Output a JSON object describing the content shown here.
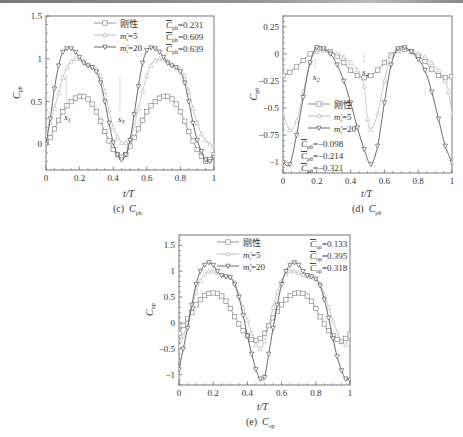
{
  "chart_data": [
    {
      "id": "c",
      "type": "line",
      "caption": "(c)  C_ph",
      "caption_prefix": "(c)",
      "caption_symbol": "C",
      "caption_sub": "ph",
      "xlabel": "t/T",
      "ylabel": "C_ph",
      "ylabel_sub": "ph",
      "xlim": [
        0,
        1
      ],
      "ylim": [
        -0.3,
        1.5
      ],
      "xticks": [
        0,
        0.2,
        0.4,
        0.6,
        0.8,
        1
      ],
      "xtick_labels": [
        "0",
        "0.2",
        "0.4",
        "0.6",
        "0.8",
        "1"
      ],
      "yticks": [
        0,
        0.5,
        1,
        1.5
      ],
      "ytick_labels": [
        "0",
        "0.5",
        "1",
        "1.5"
      ],
      "legend": [
        "刚性",
        "m*=5",
        "m*=20"
      ],
      "legend_position": "upper center",
      "mean_labels": [
        "C̄ph=0.231",
        "C̄ph=0.609",
        "C̄ph=0.639"
      ],
      "mean_values": [
        0.231,
        0.609,
        0.639
      ],
      "annotations": [
        {
          "text": "s1",
          "x": 0.12,
          "y": 0.38
        },
        {
          "text": "s3",
          "x": 0.44,
          "y": 0.35
        }
      ],
      "series": [
        {
          "name": "刚性",
          "marker": "square",
          "color": "#8a8a8a",
          "x": [
            0,
            0.025,
            0.05,
            0.075,
            0.1,
            0.125,
            0.15,
            0.175,
            0.2,
            0.225,
            0.25,
            0.275,
            0.3,
            0.325,
            0.35,
            0.375,
            0.4,
            0.425,
            0.45,
            0.475,
            0.5,
            0.525,
            0.55,
            0.575,
            0.6,
            0.625,
            0.65,
            0.675,
            0.7,
            0.725,
            0.75,
            0.775,
            0.8,
            0.825,
            0.85,
            0.875,
            0.9,
            0.925,
            0.95,
            0.975,
            1
          ],
          "values": [
            0.02,
            0.08,
            0.18,
            0.28,
            0.38,
            0.45,
            0.5,
            0.54,
            0.56,
            0.56,
            0.53,
            0.47,
            0.38,
            0.27,
            0.15,
            0.04,
            -0.06,
            -0.12,
            -0.15,
            -0.12,
            -0.02,
            0.08,
            0.18,
            0.28,
            0.38,
            0.45,
            0.5,
            0.54,
            0.56,
            0.56,
            0.53,
            0.47,
            0.38,
            0.27,
            0.15,
            0.04,
            -0.06,
            -0.14,
            -0.2,
            -0.18,
            -0.12
          ]
        },
        {
          "name": "m*=5",
          "marker": "triangle-up",
          "color": "#b5b5b5",
          "x": [
            0,
            0.025,
            0.05,
            0.075,
            0.1,
            0.125,
            0.15,
            0.175,
            0.2,
            0.225,
            0.25,
            0.275,
            0.3,
            0.325,
            0.35,
            0.375,
            0.4,
            0.425,
            0.45,
            0.475,
            0.5,
            0.525,
            0.55,
            0.575,
            0.6,
            0.625,
            0.65,
            0.675,
            0.7,
            0.725,
            0.75,
            0.775,
            0.8,
            0.825,
            0.85,
            0.875,
            0.9,
            0.925,
            0.95,
            0.975,
            1
          ],
          "values": [
            0.1,
            0.25,
            0.42,
            0.6,
            0.78,
            0.9,
            0.97,
            1.0,
            1.0,
            0.97,
            0.93,
            0.9,
            0.88,
            0.8,
            0.62,
            0.4,
            0.2,
            0.08,
            0.02,
            0.02,
            0.06,
            0.22,
            0.42,
            0.62,
            0.8,
            0.92,
            0.98,
            1.0,
            1.0,
            0.97,
            0.93,
            0.9,
            0.88,
            0.8,
            0.62,
            0.42,
            0.25,
            0.12,
            0.05,
            0.0,
            -0.02
          ]
        },
        {
          "name": "m*=20",
          "marker": "triangle-down",
          "color": "#5a5a5a",
          "x": [
            0,
            0.025,
            0.05,
            0.075,
            0.1,
            0.125,
            0.15,
            0.175,
            0.2,
            0.225,
            0.25,
            0.275,
            0.3,
            0.325,
            0.35,
            0.375,
            0.4,
            0.425,
            0.45,
            0.475,
            0.5,
            0.525,
            0.55,
            0.575,
            0.6,
            0.625,
            0.65,
            0.675,
            0.7,
            0.725,
            0.75,
            0.775,
            0.8,
            0.825,
            0.85,
            0.875,
            0.9,
            0.925,
            0.95,
            0.975,
            1
          ],
          "values": [
            0.0,
            0.3,
            0.65,
            0.92,
            1.08,
            1.12,
            1.12,
            1.08,
            1.02,
            0.95,
            0.92,
            0.9,
            0.85,
            0.72,
            0.5,
            0.25,
            0.02,
            -0.12,
            -0.18,
            -0.12,
            0.05,
            0.35,
            0.68,
            0.95,
            1.1,
            1.13,
            1.12,
            1.08,
            1.02,
            0.95,
            0.92,
            0.9,
            0.85,
            0.72,
            0.5,
            0.25,
            0.05,
            -0.08,
            -0.18,
            -0.2,
            -0.15
          ]
        }
      ]
    },
    {
      "id": "d",
      "type": "line",
      "caption": "(d)  C_pθ",
      "caption_prefix": "(d)",
      "caption_symbol": "C",
      "caption_sub": "pθ",
      "xlabel": "t/T",
      "ylabel": "C_pθ",
      "ylabel_sub": "pθ",
      "xlim": [
        0,
        1
      ],
      "ylim": [
        -1.1,
        0.35
      ],
      "xticks": [
        0,
        0.2,
        0.4,
        0.6,
        0.8,
        1
      ],
      "xtick_labels": [
        "0",
        "0.2",
        "0.4",
        "0.6",
        "0.8",
        "1"
      ],
      "yticks": [
        -1,
        -0.75,
        -0.5,
        -0.25,
        0,
        0.25
      ],
      "ytick_labels": [
        "-1",
        "-0.75",
        "-0.5",
        "-0.25",
        "0",
        "0.25"
      ],
      "legend": [
        "刚性",
        "m*=5",
        "m*=20"
      ],
      "legend_position": "lower left",
      "mean_labels": [
        "C̄pθ=−0.098",
        "C̄pθ=−0.214",
        "C̄pθ=−0.321"
      ],
      "mean_values": [
        -0.098,
        -0.214,
        -0.321
      ],
      "annotations": [
        {
          "text": "s2",
          "x": 0.19,
          "y": -0.17
        },
        {
          "text": "s4",
          "x": 0.48,
          "y": -0.12
        }
      ],
      "series": [
        {
          "name": "刚性",
          "marker": "square",
          "color": "#8a8a8a",
          "x": [
            0,
            0.04,
            0.08,
            0.12,
            0.16,
            0.2,
            0.24,
            0.28,
            0.32,
            0.36,
            0.4,
            0.44,
            0.48,
            0.52,
            0.56,
            0.6,
            0.64,
            0.68,
            0.72,
            0.76,
            0.8,
            0.84,
            0.88,
            0.92,
            0.96,
            1
          ],
          "values": [
            -0.2,
            -0.17,
            -0.12,
            -0.06,
            0.0,
            0.04,
            0.04,
            0.02,
            -0.02,
            -0.08,
            -0.15,
            -0.2,
            -0.22,
            -0.2,
            -0.15,
            -0.08,
            -0.01,
            0.03,
            0.04,
            0.02,
            -0.02,
            -0.07,
            -0.14,
            -0.2,
            -0.22,
            -0.21
          ]
        },
        {
          "name": "m*=5",
          "marker": "triangle-up",
          "color": "#b5b5b5",
          "x": [
            0,
            0.04,
            0.08,
            0.12,
            0.16,
            0.2,
            0.24,
            0.28,
            0.32,
            0.36,
            0.4,
            0.44,
            0.48,
            0.5,
            0.52,
            0.56,
            0.6,
            0.64,
            0.68,
            0.72,
            0.76,
            0.8,
            0.84,
            0.88,
            0.92,
            0.96,
            0.98,
            1
          ],
          "values": [
            -0.55,
            -0.7,
            -0.62,
            -0.35,
            -0.08,
            0.02,
            0.03,
            0.02,
            0.0,
            -0.03,
            -0.08,
            -0.15,
            -0.3,
            -0.6,
            -0.7,
            -0.55,
            -0.25,
            -0.02,
            0.05,
            0.04,
            0.02,
            0.0,
            -0.03,
            -0.08,
            -0.15,
            -0.25,
            -0.35,
            -0.55
          ]
        },
        {
          "name": "m*=20",
          "marker": "triangle-down",
          "color": "#5a5a5a",
          "x": [
            0,
            0.04,
            0.08,
            0.12,
            0.16,
            0.2,
            0.24,
            0.28,
            0.32,
            0.36,
            0.4,
            0.44,
            0.48,
            0.52,
            0.56,
            0.6,
            0.64,
            0.68,
            0.72,
            0.76,
            0.8,
            0.84,
            0.88,
            0.92,
            0.96,
            1
          ],
          "values": [
            -1.0,
            -1.02,
            -0.75,
            -0.4,
            -0.08,
            0.06,
            0.05,
            0.0,
            -0.1,
            -0.25,
            -0.45,
            -0.68,
            -0.88,
            -1.02,
            -0.85,
            -0.45,
            -0.1,
            0.05,
            0.06,
            0.02,
            -0.05,
            -0.15,
            -0.35,
            -0.6,
            -0.85,
            -1.0
          ]
        }
      ]
    },
    {
      "id": "e",
      "type": "line",
      "caption": "(e)  C_op",
      "caption_prefix": "(e)",
      "caption_symbol": "C",
      "caption_sub": "op",
      "xlabel": "t/T",
      "ylabel": "C_op",
      "ylabel_sub": "op",
      "xlim": [
        0,
        1
      ],
      "ylim": [
        -1.2,
        1.7
      ],
      "xticks": [
        0,
        0.2,
        0.4,
        0.6,
        0.8,
        1
      ],
      "xtick_labels": [
        "0",
        "0.2",
        "0.4",
        "0.6",
        "0.8",
        "1"
      ],
      "yticks": [
        -1,
        -0.5,
        0,
        0.5,
        1,
        1.5
      ],
      "ytick_labels": [
        "-1",
        "-0.5",
        "0",
        "0.5",
        "1",
        "1.5"
      ],
      "legend": [
        "刚性",
        "m*=5",
        "m*=20"
      ],
      "legend_position": "upper left",
      "mean_labels": [
        "C̄op=0.133",
        "C̄op=0.395",
        "C̄op=0.318"
      ],
      "mean_values": [
        0.133,
        0.395,
        0.318
      ],
      "annotations": [],
      "series": [
        {
          "name": "刚性",
          "marker": "square",
          "color": "#8a8a8a",
          "x": [
            0,
            0.025,
            0.05,
            0.075,
            0.1,
            0.125,
            0.15,
            0.175,
            0.2,
            0.225,
            0.25,
            0.275,
            0.3,
            0.325,
            0.35,
            0.375,
            0.4,
            0.425,
            0.45,
            0.475,
            0.5,
            0.525,
            0.55,
            0.575,
            0.6,
            0.625,
            0.65,
            0.675,
            0.7,
            0.725,
            0.75,
            0.775,
            0.8,
            0.825,
            0.85,
            0.875,
            0.9,
            0.925,
            0.95,
            0.975,
            1
          ],
          "values": [
            -0.2,
            -0.05,
            0.08,
            0.2,
            0.35,
            0.45,
            0.53,
            0.57,
            0.58,
            0.57,
            0.52,
            0.42,
            0.28,
            0.12,
            -0.02,
            -0.15,
            -0.25,
            -0.32,
            -0.34,
            -0.3,
            -0.2,
            -0.05,
            0.1,
            0.22,
            0.35,
            0.45,
            0.53,
            0.57,
            0.58,
            0.57,
            0.52,
            0.42,
            0.28,
            0.12,
            -0.02,
            -0.15,
            -0.25,
            -0.32,
            -0.36,
            -0.3,
            -0.22
          ]
        },
        {
          "name": "m*=5",
          "marker": "triangle-up",
          "color": "#b5b5b5",
          "x": [
            0,
            0.025,
            0.05,
            0.075,
            0.1,
            0.125,
            0.15,
            0.175,
            0.2,
            0.225,
            0.25,
            0.275,
            0.3,
            0.325,
            0.35,
            0.375,
            0.4,
            0.425,
            0.45,
            0.475,
            0.5,
            0.525,
            0.55,
            0.575,
            0.6,
            0.625,
            0.65,
            0.675,
            0.7,
            0.725,
            0.75,
            0.775,
            0.8,
            0.825,
            0.85,
            0.875,
            0.9,
            0.925,
            0.95,
            0.975,
            1
          ],
          "values": [
            -0.45,
            -0.25,
            0.0,
            0.3,
            0.6,
            0.82,
            0.95,
            1.0,
            1.0,
            0.97,
            0.93,
            0.9,
            0.88,
            0.78,
            0.55,
            0.3,
            0.05,
            -0.2,
            -0.42,
            -0.5,
            -0.35,
            -0.05,
            0.3,
            0.6,
            0.82,
            0.95,
            1.0,
            1.0,
            0.97,
            0.93,
            0.9,
            0.88,
            0.85,
            0.75,
            0.55,
            0.3,
            0.05,
            -0.18,
            -0.35,
            -0.42,
            -0.25
          ]
        },
        {
          "name": "m*=20",
          "marker": "triangle-down",
          "color": "#5a5a5a",
          "x": [
            0,
            0.025,
            0.05,
            0.075,
            0.1,
            0.125,
            0.15,
            0.175,
            0.2,
            0.225,
            0.25,
            0.275,
            0.3,
            0.325,
            0.35,
            0.375,
            0.4,
            0.425,
            0.45,
            0.475,
            0.5,
            0.525,
            0.55,
            0.575,
            0.6,
            0.625,
            0.65,
            0.675,
            0.7,
            0.725,
            0.75,
            0.775,
            0.8,
            0.825,
            0.85,
            0.875,
            0.9,
            0.925,
            0.95,
            0.975,
            1
          ],
          "values": [
            -0.9,
            -0.5,
            -0.1,
            0.35,
            0.75,
            1.0,
            1.12,
            1.17,
            1.12,
            1.0,
            0.92,
            0.9,
            0.88,
            0.75,
            0.5,
            0.15,
            -0.25,
            -0.6,
            -0.9,
            -1.08,
            -1.05,
            -0.6,
            -0.1,
            0.35,
            0.75,
            1.0,
            1.12,
            1.17,
            1.12,
            1.0,
            0.92,
            0.9,
            0.85,
            0.72,
            0.45,
            0.1,
            -0.3,
            -0.65,
            -0.92,
            -1.08,
            -1.1
          ]
        }
      ]
    }
  ],
  "layout": {
    "panels": [
      {
        "x0": 46,
        "y0": 16,
        "x1": 214,
        "y1": 170
      },
      {
        "x0": 283,
        "y0": 16,
        "x1": 452,
        "y1": 173
      },
      {
        "x0": 179,
        "y0": 235,
        "x1": 350,
        "y1": 385
      }
    ]
  }
}
